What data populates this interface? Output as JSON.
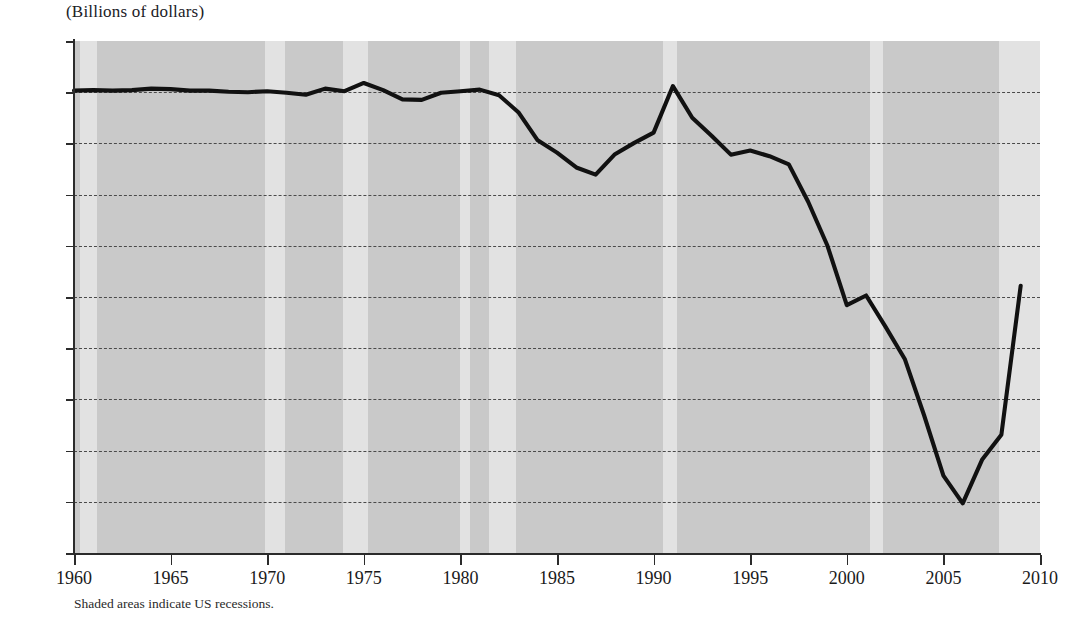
{
  "chart_data": {
    "type": "line",
    "title": "(Billions of dollars)",
    "subtitle": "",
    "xlabel": "",
    "ylabel": "(Billions of dollars)",
    "xlim": [
      1960,
      2010
    ],
    "ylim": [
      -900,
      100
    ],
    "grid": true,
    "legend": null,
    "footnote": "Shaded areas indicate US recessions.",
    "line_color": "#111111",
    "plot_background_color": "#c9c9c9",
    "recession_band_color": "#e2e2e2",
    "x_ticks": [
      1960,
      1965,
      1970,
      1975,
      1980,
      1985,
      1990,
      1995,
      2000,
      2005,
      2010
    ],
    "y_ticks": [
      100,
      0,
      -100,
      -200,
      -300,
      -400,
      -500,
      -600,
      -700,
      -800,
      -900
    ],
    "y_tick_labels": [
      "100",
      "0",
      "−100",
      "−200",
      "−300",
      "−400",
      "−500",
      "−600",
      "−700",
      "−800",
      "−900"
    ],
    "x": [
      1960,
      1961,
      1962,
      1963,
      1964,
      1965,
      1966,
      1967,
      1968,
      1969,
      1970,
      1971,
      1972,
      1973,
      1974,
      1975,
      1976,
      1977,
      1978,
      1979,
      1980,
      1981,
      1982,
      1983,
      1984,
      1985,
      1986,
      1987,
      1988,
      1989,
      1990,
      1991,
      1992,
      1993,
      1994,
      1995,
      1996,
      1997,
      1998,
      1999,
      2000,
      2001,
      2002,
      2003,
      2004,
      2005,
      2006,
      2007,
      2008,
      2009
    ],
    "values": [
      3,
      4,
      3,
      4,
      7,
      6,
      3,
      3,
      1,
      0,
      2,
      -1,
      -5,
      7,
      2,
      18,
      4,
      -14,
      -15,
      -1,
      2,
      5,
      -6,
      -39,
      -94,
      -118,
      -147,
      -161,
      -121,
      -99,
      -79,
      12,
      -50,
      -85,
      -122,
      -114,
      -125,
      -141,
      -214,
      -300,
      -416,
      -397,
      -458,
      -521,
      -631,
      -749,
      -803,
      -718,
      -669,
      -378
    ],
    "series": [
      {
        "name": "Current account balance",
        "values": [
          3,
          4,
          3,
          4,
          7,
          6,
          3,
          3,
          1,
          0,
          2,
          -1,
          -5,
          7,
          2,
          18,
          4,
          -14,
          -15,
          -1,
          2,
          5,
          -6,
          -39,
          -94,
          -118,
          -147,
          -161,
          -121,
          -99,
          -79,
          12,
          -50,
          -85,
          -122,
          -114,
          -125,
          -141,
          -214,
          -300,
          -416,
          -397,
          -458,
          -521,
          -631,
          -749,
          -803,
          -718,
          -669,
          -378
        ]
      }
    ],
    "recession_bands": [
      {
        "start": 1960.3,
        "end": 1961.2
      },
      {
        "start": 1969.9,
        "end": 1970.9
      },
      {
        "start": 1973.9,
        "end": 1975.2
      },
      {
        "start": 1980.0,
        "end": 1980.5
      },
      {
        "start": 1981.5,
        "end": 1982.9
      },
      {
        "start": 1990.5,
        "end": 1991.2
      },
      {
        "start": 2001.2,
        "end": 2001.9
      },
      {
        "start": 2007.9,
        "end": 2010.0
      }
    ]
  }
}
